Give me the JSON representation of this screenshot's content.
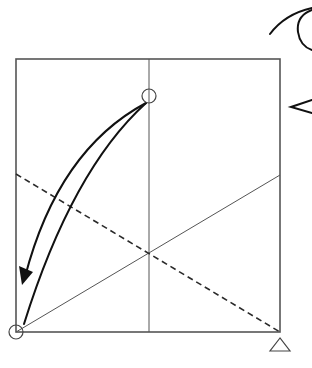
{
  "diagram": {
    "title": "Origami fold step: bring top-center point down to bottom-left corner",
    "colors": {
      "edge": "#555555",
      "crease": "#555555",
      "valley_fold": "#2a2a2a",
      "arrow": "#111111",
      "marker": "#444444"
    },
    "paper_square": {
      "x": 16,
      "y": 59,
      "width": 264,
      "height": 273
    },
    "creases": [
      {
        "name": "vertical-center-crease",
        "x1": 149,
        "y1": 59,
        "x2": 149,
        "y2": 332
      },
      {
        "name": "diagonal-crease",
        "x1": 16,
        "y1": 332,
        "x2": 280,
        "y2": 175
      }
    ],
    "valley_fold_line": {
      "x1": 16,
      "y1": 174,
      "x2": 280,
      "y2": 332
    },
    "fold_arrow": {
      "outer_path": "M146 103 Q 58 150 24 280",
      "inner_path": "M146 103 Q 72 170 24 324",
      "arrowhead": "16,290 34,275 22,265"
    },
    "markers": {
      "top_circle": {
        "cx": 149,
        "cy": 96,
        "r": 7,
        "icon": "reference-circle"
      },
      "corner_circle": {
        "cx": 16,
        "cy": 332,
        "r": 7,
        "icon": "reference-circle"
      },
      "corner_triangle": {
        "points": "280,338 270,351 290,351",
        "icon": "reference-triangle"
      }
    },
    "symbols": {
      "top_right": "turn-over / view symbol (partial, cropped)",
      "right_edge": "viewing-direction chevron (partial, cropped)"
    }
  }
}
